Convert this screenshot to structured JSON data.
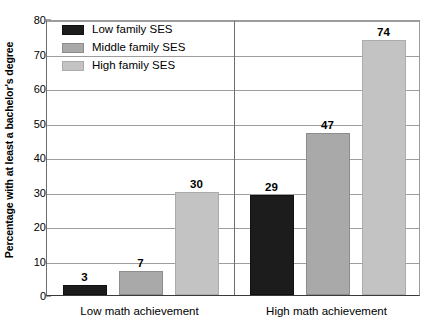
{
  "chart_data": {
    "type": "bar",
    "title": "",
    "subtitle": "",
    "xlabel": "",
    "ylabel": "Percentage with at least a bachelor's degree",
    "ylim": [
      0,
      80
    ],
    "yticks": [
      0,
      10,
      20,
      30,
      40,
      50,
      60,
      70,
      80
    ],
    "ytick_labels": [
      "0",
      "10",
      "20",
      "30",
      "40",
      "50",
      "60",
      "70",
      "80"
    ],
    "grid": true,
    "legend_position": "top-left-inside",
    "categories": [
      "Low math achievement",
      "High math achievement"
    ],
    "series": [
      {
        "name": "Low family SES",
        "color": "#1c1c1c",
        "values": [
          3,
          29
        ],
        "value_labels": [
          "3",
          "29"
        ]
      },
      {
        "name": "Middle family SES",
        "color": "#a9a9a9",
        "values": [
          7,
          47
        ],
        "value_labels": [
          "7",
          "47"
        ]
      },
      {
        "name": "High family SES",
        "color": "#c3c3c3",
        "values": [
          30,
          74
        ],
        "value_labels": [
          "30",
          "74"
        ]
      }
    ],
    "annotations": []
  },
  "axis": {
    "y_title": "Percentage with at least a bachelor's degree",
    "ticks": [
      {
        "label": "80",
        "value": 80
      },
      {
        "label": "70",
        "value": 70
      },
      {
        "label": "60",
        "value": 60
      },
      {
        "label": "50",
        "value": 50
      },
      {
        "label": "40",
        "value": 40
      },
      {
        "label": "30",
        "value": 30
      },
      {
        "label": "20",
        "value": 20
      },
      {
        "label": "10",
        "value": 10
      },
      {
        "label": "0",
        "value": 0
      }
    ]
  },
  "legend": {
    "items": [
      {
        "label": "Low family SES",
        "color": "#1c1c1c"
      },
      {
        "label": "Middle family SES",
        "color": "#a9a9a9"
      },
      {
        "label": "High family SES",
        "color": "#c3c3c3"
      }
    ]
  },
  "categories": [
    {
      "label": "Low math achievement"
    },
    {
      "label": "High math achievement"
    }
  ],
  "bars": [
    {
      "group": 0,
      "series": 0,
      "series_name": "Low family SES",
      "value": 3,
      "label": "3"
    },
    {
      "group": 0,
      "series": 1,
      "series_name": "Middle family SES",
      "value": 7,
      "label": "7"
    },
    {
      "group": 0,
      "series": 2,
      "series_name": "High family SES",
      "value": 30,
      "label": "30"
    },
    {
      "group": 1,
      "series": 0,
      "series_name": "Low family SES",
      "value": 29,
      "label": "29"
    },
    {
      "group": 1,
      "series": 1,
      "series_name": "Middle family SES",
      "value": 47,
      "label": "47"
    },
    {
      "group": 1,
      "series": 2,
      "series_name": "High family SES",
      "value": 74,
      "label": "74"
    }
  ]
}
